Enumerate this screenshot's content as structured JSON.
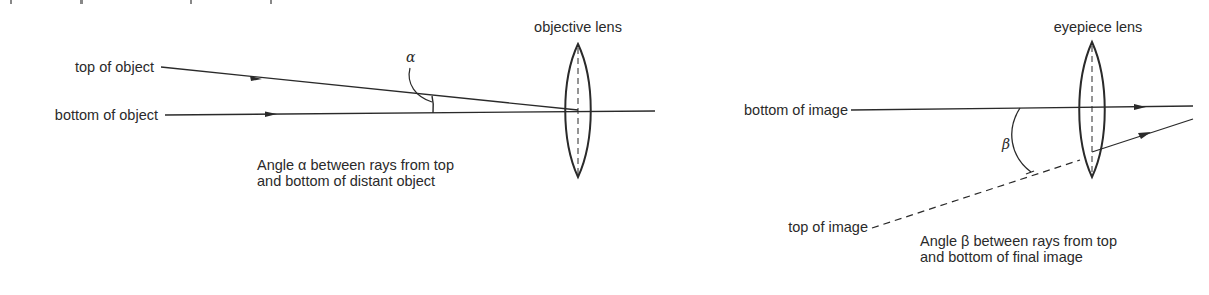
{
  "diagram": {
    "left_panel": {
      "lens_label": "objective lens",
      "ray_labels": {
        "top": "top of object",
        "bottom": "bottom of object"
      },
      "angle_symbol": "α",
      "caption_line1": "Angle α between rays from top",
      "caption_line2": "and bottom of distant object"
    },
    "right_panel": {
      "lens_label": "eyepiece lens",
      "ray_labels": {
        "bottom": "bottom of image",
        "top": "top of image"
      },
      "angle_symbol": "β",
      "caption_line1": "Angle β between rays from top",
      "caption_line2": "and bottom of final image"
    },
    "colors": {
      "ink": "#2a2a2a",
      "background": "#ffffff"
    }
  }
}
